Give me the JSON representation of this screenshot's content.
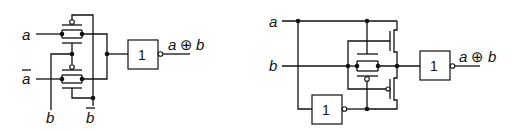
{
  "left_circuit": {
    "inputs": {
      "a": "a",
      "a_bar": "a",
      "b": "b",
      "b_bar": "b"
    },
    "gate_label": "1",
    "output_label": "a ⊕ b",
    "output_text_a": "a",
    "output_text_op": "⊕",
    "output_text_b": "b"
  },
  "right_circuit": {
    "inputs": {
      "a": "a",
      "b": "b"
    },
    "inverter_label": "1",
    "gate_label": "1",
    "output_text_a": "a",
    "output_text_op": "⊕",
    "output_text_b": "b"
  },
  "colors": {
    "wire": "#111111",
    "background": "#ffffff"
  }
}
